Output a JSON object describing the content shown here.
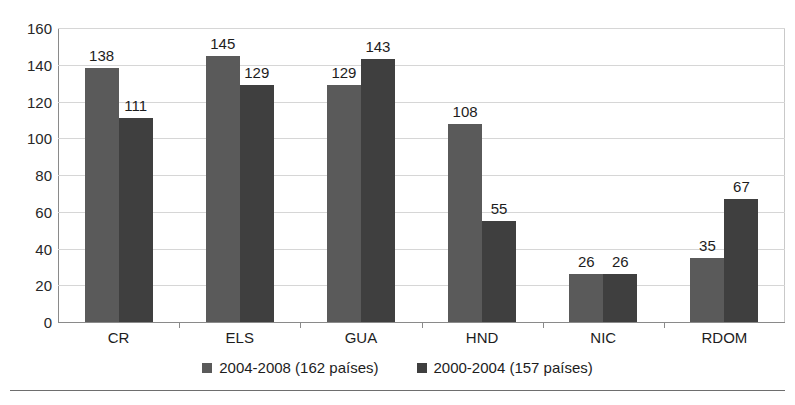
{
  "chart_data": {
    "type": "bar",
    "title": "",
    "xlabel": "",
    "ylabel": "",
    "ylim": [
      0,
      160
    ],
    "yticks": [
      0,
      20,
      40,
      60,
      80,
      100,
      120,
      140,
      160
    ],
    "grid": true,
    "legend_position": "bottom",
    "categories": [
      "CR",
      "ELS",
      "GUA",
      "HND",
      "NIC",
      "RDOM"
    ],
    "series": [
      {
        "name": "2004-2008 (162 países)",
        "color": "#5a5a5a",
        "values": [
          138,
          145,
          129,
          108,
          26,
          35
        ]
      },
      {
        "name": "2000-2004 (157 países)",
        "color": "#3f3f3f",
        "values": [
          111,
          129,
          143,
          55,
          26,
          67
        ]
      }
    ]
  },
  "axis": {
    "ytick_labels": [
      "160",
      "140",
      "120",
      "100",
      "80",
      "60",
      "40",
      "20",
      "0"
    ]
  },
  "legend": {
    "entries": [
      {
        "label": "2004-2008 (162 países)"
      },
      {
        "label": "2000-2004 (157 países)"
      }
    ]
  }
}
